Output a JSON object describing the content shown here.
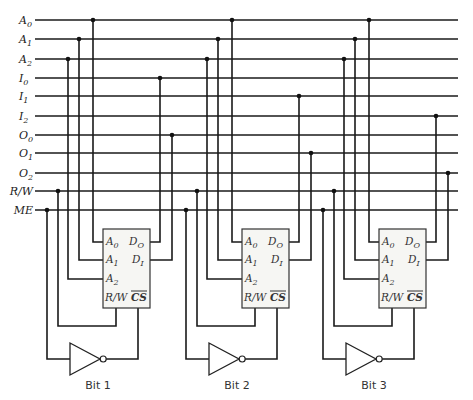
{
  "diagram": {
    "type": "memory-bit-slice-schematic",
    "bus_lines": [
      {
        "name": "A",
        "sub": "0",
        "y": 20
      },
      {
        "name": "A",
        "sub": "1",
        "y": 39
      },
      {
        "name": "A",
        "sub": "2",
        "y": 59
      },
      {
        "name": "I",
        "sub": "0",
        "y": 78
      },
      {
        "name": "I",
        "sub": "1",
        "y": 96
      },
      {
        "name": "I",
        "sub": "2",
        "y": 116
      },
      {
        "name": "O",
        "sub": "0",
        "y": 135
      },
      {
        "name": "O",
        "sub": "1",
        "y": 153
      },
      {
        "name": "O",
        "sub": "2",
        "y": 173
      },
      {
        "name": "R/W",
        "sub": "",
        "y": 191
      },
      {
        "name": "ME",
        "sub": "",
        "y": 210
      }
    ],
    "chip_pins": {
      "a0": "A",
      "a0_sub": "0",
      "a1": "A",
      "a1_sub": "1",
      "a2": "A",
      "a2_sub": "2",
      "do": "D",
      "do_sub": "O",
      "di": "D",
      "di_sub": "I",
      "rw": "R/W",
      "cs": "CS"
    },
    "blocks": [
      {
        "label": "Bit 1",
        "offset": 0,
        "i_line": "I0",
        "o_line": "O0"
      },
      {
        "label": "Bit 2",
        "offset": 139,
        "i_line": "I1",
        "o_line": "O1"
      },
      {
        "label": "Bit 3",
        "offset": 276,
        "i_line": "I2",
        "o_line": "O2"
      }
    ]
  }
}
